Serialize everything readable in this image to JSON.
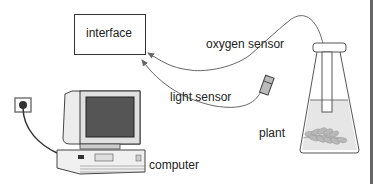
{
  "diagram": {
    "type": "experimental-setup",
    "nodes": [
      {
        "id": "interface",
        "label": "interface"
      },
      {
        "id": "oxygen_sensor",
        "label": "oxygen sensor"
      },
      {
        "id": "light_sensor",
        "label": "light sensor"
      },
      {
        "id": "plant",
        "label": "plant"
      },
      {
        "id": "computer",
        "label": "computer"
      }
    ],
    "edges": [
      {
        "from": "oxygen_sensor",
        "to": "interface",
        "style": "arrow"
      },
      {
        "from": "light_sensor",
        "to": "interface",
        "style": "arrow"
      },
      {
        "from": "computer",
        "to": "power_socket",
        "style": "cable"
      }
    ]
  },
  "labels": {
    "interface": "interface",
    "oxygen_sensor": "oxygen sensor",
    "light_sensor": "light sensor",
    "plant": "plant",
    "computer": "computer"
  },
  "colors": {
    "line": "#555555",
    "box_border": "#333333",
    "water": "#e4e4e4",
    "plant": "#b5b5b5",
    "computer_body": "#e8e8e8",
    "screen": "#555555",
    "right_bar": "#666666"
  }
}
